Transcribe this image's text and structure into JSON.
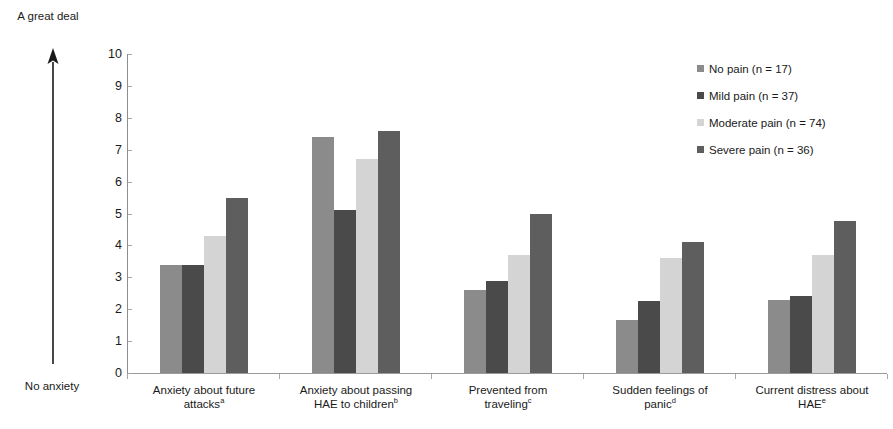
{
  "axis_annotation": {
    "top_label": "A great deal",
    "bottom_label": "No anxiety",
    "arrow_icon": "up-arrow-icon"
  },
  "legend": {
    "position": "top-right",
    "entries": [
      {
        "label": "No pain (n = 17)",
        "color": "#8b8b8b"
      },
      {
        "label": "Mild pain (n = 37)",
        "color": "#4a4a4a"
      },
      {
        "label": "Moderate pain (n = 74)",
        "color": "#d4d4d4"
      },
      {
        "label": "Severe pain (n = 36)",
        "color": "#5e5e5e"
      }
    ]
  },
  "chart_data": {
    "type": "bar",
    "title": "",
    "xlabel": "",
    "ylabel": "",
    "ylim": [
      0,
      10
    ],
    "ytick_labels": [
      "0",
      "1",
      "2",
      "3",
      "4",
      "5",
      "6",
      "7",
      "8",
      "9",
      "10"
    ],
    "grid": false,
    "legend_position": "top-right",
    "categories": [
      "Anxiety about future attacks",
      "Anxiety about passing HAE to children",
      "Prevented from traveling",
      "Sudden feelings of panic",
      "Current distress about HAE"
    ],
    "category_lines": [
      [
        "Anxiety about future",
        "attacks"
      ],
      [
        "Anxiety about passing",
        "HAE to children"
      ],
      [
        "Prevented from",
        "traveling"
      ],
      [
        "Sudden feelings of",
        "panic"
      ],
      [
        "Current distress about",
        "HAE"
      ]
    ],
    "category_footnotes": [
      "a",
      "b",
      "c",
      "d",
      "e"
    ],
    "series": [
      {
        "name": "No pain (n = 17)",
        "color": "#8b8b8b",
        "values": [
          3.4,
          7.4,
          2.6,
          1.65,
          2.3
        ]
      },
      {
        "name": "Mild pain (n = 37)",
        "color": "#4a4a4a",
        "values": [
          3.4,
          5.1,
          2.9,
          2.25,
          2.4
        ]
      },
      {
        "name": "Moderate pain (n = 74)",
        "color": "#d4d4d4",
        "values": [
          4.3,
          6.7,
          3.7,
          3.6,
          3.7
        ]
      },
      {
        "name": "Severe pain (n = 36)",
        "color": "#5e5e5e",
        "values": [
          5.5,
          7.6,
          5.0,
          4.1,
          4.75
        ]
      }
    ]
  }
}
